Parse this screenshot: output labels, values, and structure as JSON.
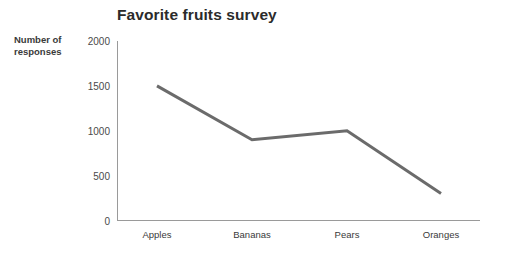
{
  "chart_data": {
    "type": "line",
    "title": "Favorite fruits survey",
    "xlabel": "",
    "ylabel": "Number of responses",
    "categories": [
      "Apples",
      "Bananas",
      "Pears",
      "Oranges"
    ],
    "values": [
      1500,
      900,
      1000,
      300
    ],
    "series": [
      {
        "name": "Number of responses",
        "values": [
          1500,
          900,
          1000,
          300
        ]
      }
    ],
    "ylim": [
      0,
      2000
    ],
    "y_ticks": [
      2000,
      1500,
      1000,
      500,
      0
    ],
    "y_tick_labels": [
      "2000",
      "1500",
      "1000",
      "500",
      "0"
    ],
    "grid": false,
    "legend": "none",
    "line_color": "#6b6b6b",
    "axis_color": "#9a9a9a",
    "title_color": "#2b2b2b",
    "background": "#ffffff"
  },
  "labels": {
    "title": "Favorite fruits survey",
    "y_axis_title_line1": "Number of",
    "y_axis_title_line2": "responses",
    "y_ticks": {
      "t0": "2000",
      "t1": "1500",
      "t2": "1000",
      "t3": "500",
      "t4": "0"
    },
    "x_ticks": {
      "c0": "Apples",
      "c1": "Bananas",
      "c2": "Pears",
      "c3": "Oranges"
    }
  }
}
